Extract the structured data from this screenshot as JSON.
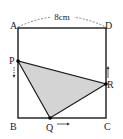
{
  "diagram": {
    "type": "geometry-square-moving-points",
    "side_length_label": "8cm",
    "vertices": {
      "A": {
        "label": "A",
        "x": 18,
        "y": 28
      },
      "D": {
        "label": "D",
        "x": 106,
        "y": 28
      },
      "B": {
        "label": "B",
        "x": 18,
        "y": 118
      },
      "C": {
        "label": "C",
        "x": 106,
        "y": 118
      }
    },
    "moving_points": {
      "P": {
        "label": "P",
        "x": 18,
        "y": 61,
        "on_side": "AB",
        "direction": "down"
      },
      "Q": {
        "label": "Q",
        "x": 50,
        "y": 118,
        "on_side": "BC",
        "direction": "right"
      },
      "R": {
        "label": "R",
        "x": 106,
        "y": 84,
        "on_side": "DC",
        "direction": "up"
      }
    },
    "shaded_region": "triangle PQR",
    "colors": {
      "stroke": "#1a1a1a",
      "shade": "#d4d4d4",
      "dashed": "#666666"
    }
  }
}
